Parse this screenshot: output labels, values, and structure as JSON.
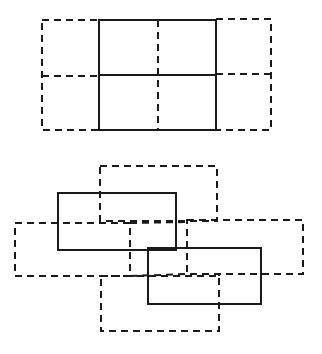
{
  "diagram": {
    "colors": {
      "stroke": "#1a1a1a",
      "background": "#ffffff"
    },
    "figures": [
      {
        "id": "top-grid",
        "solid_rects": [
          {
            "x": 99,
            "y": 20,
            "w": 117,
            "h": 110
          }
        ],
        "solid_lines": [
          {
            "x1": 99,
            "y1": 75,
            "x2": 216,
            "y2": 75
          }
        ],
        "dashed_rects": [
          {
            "x": 42,
            "y": 20,
            "w": 57,
            "h": 110
          },
          {
            "x": 216,
            "y": 19,
            "w": 55,
            "h": 111
          }
        ],
        "dashed_lines": [
          {
            "x1": 158,
            "y1": 20,
            "x2": 158,
            "y2": 130
          },
          {
            "x1": 42,
            "y1": 76,
            "x2": 99,
            "y2": 76
          },
          {
            "x1": 216,
            "y1": 74,
            "x2": 271,
            "y2": 74
          }
        ]
      },
      {
        "id": "bottom-overlap",
        "solid_rects": [
          {
            "x": 58,
            "y": 193,
            "w": 118,
            "h": 57
          },
          {
            "x": 148,
            "y": 248,
            "w": 113,
            "h": 56
          }
        ],
        "solid_lines": [],
        "dashed_rects": [
          {
            "x": 100,
            "y": 166,
            "w": 117,
            "h": 55
          },
          {
            "x": 15,
            "y": 223,
            "w": 115,
            "h": 53
          },
          {
            "x": 187,
            "y": 220,
            "w": 116,
            "h": 54
          },
          {
            "x": 101,
            "y": 276,
            "w": 118,
            "h": 55
          }
        ],
        "dashed_lines": [
          {
            "x1": 130,
            "y1": 223,
            "x2": 187,
            "y2": 222
          },
          {
            "x1": 130,
            "y1": 276,
            "x2": 187,
            "y2": 274
          },
          {
            "x1": 219,
            "y1": 274,
            "x2": 219,
            "y2": 276
          }
        ]
      }
    ]
  }
}
